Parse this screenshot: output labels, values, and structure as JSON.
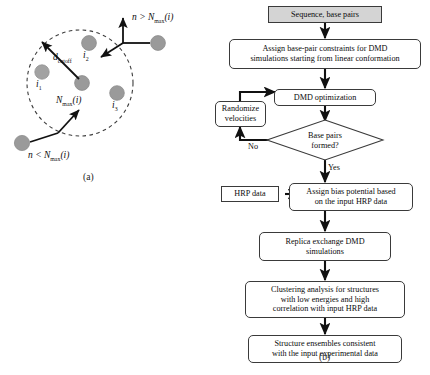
{
  "figure": {
    "panel_a_caption": "(a)",
    "panel_b_caption": "(b)"
  },
  "panel_a": {
    "title_semantic": "cutoff-sphere-neighbor-diagram",
    "labels": {
      "i1": "i",
      "i1_sub": "1",
      "i2": "i",
      "i2_sub": "2",
      "i3": "i",
      "i3_sub": "3",
      "d_cutoff": "d",
      "d_cutoff_sub": "cutoff",
      "n_max_center": "N",
      "n_max_center_sub": "max",
      "n_max_center_arg": "(i)",
      "above_label": "n > N",
      "above_label_sub": "max",
      "above_label_arg": "(i)",
      "below_label": "n < N",
      "below_label_sub": "max",
      "below_label_arg": "(i)"
    },
    "colors": {
      "particle_fill": "#9a9a9a",
      "particle_stroke": "#8a8a8a",
      "dashed_circle": "#3c3c3c",
      "arrow": "#111111"
    }
  },
  "panel_b": {
    "title_semantic": "dmd-simulation-workflow-flowchart",
    "colors": {
      "box_stroke": "#3a3a3a",
      "box_fill": "#ffffff",
      "first_box_fill": "#d4d4d4",
      "arrow": "#111111"
    },
    "nodes": [
      {
        "id": "sequence-base-pairs",
        "label": "Sequence, base pairs"
      },
      {
        "id": "assign-constraints",
        "label": "Assign base-pair constraints for DMD\nsimulations starting from linear conformation"
      },
      {
        "id": "dmd-optimization",
        "label": "DMD optimization"
      },
      {
        "id": "randomize-velocities",
        "label": "Randomize\nvelocities"
      },
      {
        "id": "base-pairs-formed",
        "label": "Base pairs\nformed?"
      },
      {
        "id": "hrp-data",
        "label": "HRP data"
      },
      {
        "id": "assign-bias-potential",
        "label": "Assign bias potential based\non the input HRP data"
      },
      {
        "id": "replica-exchange",
        "label": "Replica exchange DMD\nsimulations"
      },
      {
        "id": "clustering-analysis",
        "label": "Clustering analysis for structures\nwith low energies and high\ncorrelation with input HRP data"
      },
      {
        "id": "structure-ensembles",
        "label": "Structure ensembles consistent\nwith the input experimental data"
      }
    ],
    "edge_labels": {
      "no": "No",
      "yes": "Yes"
    }
  }
}
